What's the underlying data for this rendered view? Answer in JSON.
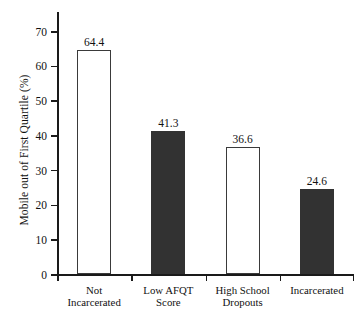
{
  "chart_data": {
    "type": "bar",
    "title": "",
    "xlabel": "",
    "ylabel": "Mobile out of First Quartile (%)",
    "ylim": [
      0,
      70
    ],
    "yticks": [
      0,
      10,
      20,
      30,
      40,
      50,
      60,
      70
    ],
    "ytick_labels": [
      "0",
      "10",
      "20",
      "30",
      "40",
      "50",
      "60",
      "70"
    ],
    "grid": false,
    "legend": null,
    "categories": [
      "Not Incarcerated",
      "Low AFQT Score",
      "High School Dropouts",
      "Incarcerated"
    ],
    "category_lines": [
      [
        "Not",
        "Incarcerated"
      ],
      [
        "Low AFQT",
        "Score"
      ],
      [
        "High School",
        "Dropouts"
      ],
      [
        "Incarcerated",
        ""
      ]
    ],
    "values": [
      64.4,
      41.3,
      36.6,
      24.6
    ],
    "value_labels": [
      "64.4",
      "41.3",
      "36.6",
      "24.6"
    ],
    "bar_styles": [
      "open",
      "filled",
      "open",
      "filled"
    ],
    "colors": {
      "open_fill": "#ffffff",
      "open_stroke": "#3a3a3a",
      "filled_fill": "#323232",
      "axis": "#1a1a1a",
      "text": "#111111",
      "background": "#ffffff"
    }
  }
}
